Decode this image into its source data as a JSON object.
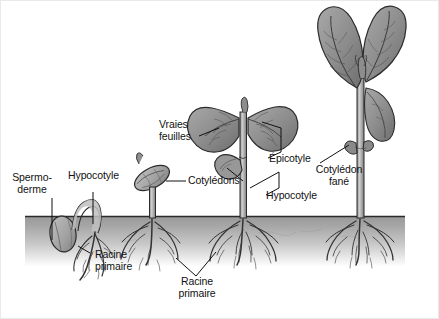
{
  "figure": {
    "language": "fr",
    "background_color": "#ffffff",
    "frame_color": "#e9e9e9",
    "soil": {
      "name": "soil-band",
      "top_color": "#9d9d9d",
      "bottom_color": "#f2f2f2",
      "line_color": "#2a2a2a",
      "left": 25,
      "right": 405,
      "surface_y": 217,
      "bottom_y": 266
    },
    "ink_colors": {
      "outline": "#2b2b2b",
      "leaf_fill": "#9a9a9a",
      "leaf_shadow": "#6f6f6f",
      "stem_fill": "#b4b4b4",
      "seed_fill": "#b0b0b0",
      "root_stroke": "#3a3a3a",
      "leader_line": "#111111"
    }
  },
  "labels": [
    {
      "id": "spermoderme",
      "name": "label-spermoderme",
      "text": "Spermo-\nderme",
      "x": 22,
      "y": 172,
      "align": "center"
    },
    {
      "id": "hypocotyle-1",
      "name": "label-hypocotyle-left",
      "text": "Hypocotyle",
      "x": 68,
      "y": 178,
      "align": "left"
    },
    {
      "id": "racine-primaire-1",
      "name": "label-racine-primaire-left",
      "text": "Racine\nprimaire",
      "x": 93,
      "y": 250,
      "align": "left"
    },
    {
      "id": "vraies-feuilles",
      "name": "label-vraies-feuilles",
      "text": "Vraies\nfeuilles",
      "x": 159,
      "y": 121,
      "align": "left"
    },
    {
      "id": "cotyledons",
      "name": "label-cotyledons",
      "text": "Cotylédons",
      "x": 188,
      "y": 177,
      "align": "left"
    },
    {
      "id": "racine-primaire-2",
      "name": "label-racine-primaire-center",
      "text": "Racine\nprimaire",
      "x": 173,
      "y": 275,
      "align": "left"
    },
    {
      "id": "epicotyle",
      "name": "label-epicotyle",
      "text": "Épicotyle",
      "x": 270,
      "y": 155,
      "align": "left"
    },
    {
      "id": "hypocotyle-2",
      "name": "label-hypocotyle-right",
      "text": "Hypocotyle",
      "x": 268,
      "y": 192,
      "align": "left"
    },
    {
      "id": "cotyledon-fane",
      "name": "label-cotyledon-fane",
      "text": "Cotylédon\nfané",
      "x": 316,
      "y": 168,
      "align": "center"
    }
  ],
  "stages": [
    {
      "id": "stage-1",
      "name": "seedling-stage-1-germination",
      "description": "Graine en germination avec spermoderme, hypocotyle en crosse et racine primaire",
      "parts": [
        "spermoderme",
        "hypocotyle",
        "racine primaire"
      ]
    },
    {
      "id": "stage-2",
      "name": "seedling-stage-2-emergence",
      "description": "Plantule émergée portant les cotylédons encore fermés",
      "parts": [
        "cotylédons",
        "hypocotyle",
        "racine primaire"
      ]
    },
    {
      "id": "stage-3",
      "name": "seedling-stage-3-first-leaves",
      "description": "Jeune plante avec vraies feuilles, épicotyle, cotylédons et hypocotyle",
      "parts": [
        "vraies feuilles",
        "cotylédons",
        "épicotyle",
        "hypocotyle",
        "racine primaire"
      ]
    },
    {
      "id": "stage-4",
      "name": "seedling-stage-4-mature",
      "description": "Plante développée avec grandes feuilles et cotylédon fané",
      "parts": [
        "vraies feuilles",
        "cotylédon fané",
        "épicotyle"
      ]
    }
  ]
}
